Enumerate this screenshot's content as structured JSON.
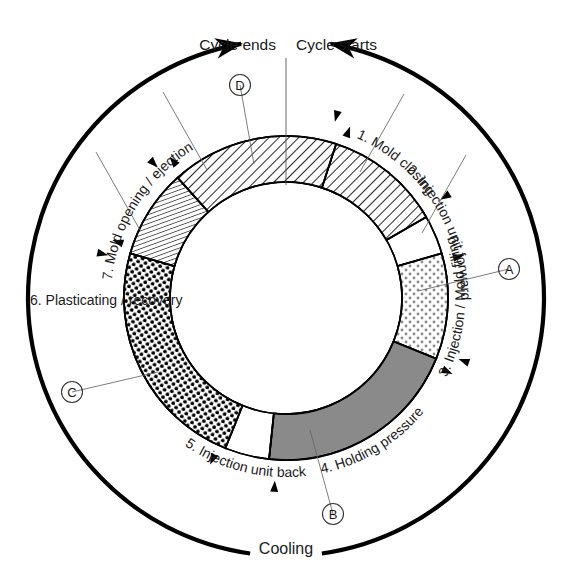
{
  "diagram": {
    "title_note": "Injection molding machine cycle diagram",
    "center": {
      "x": 286,
      "y": 298
    },
    "radii": {
      "inner": 116,
      "outer": 162,
      "tick_arc": 183,
      "cool_arc": 258
    },
    "headers": {
      "cycle_ends": "Cycle ends",
      "cycle_starts": "Cycle starts"
    },
    "cooling_label": "Cooling",
    "steps": [
      {
        "id": "s1",
        "label": "1. Mold closing",
        "fill": "hatch",
        "a0": -72,
        "a1": -30,
        "text_angle": -51
      },
      {
        "id": "s2",
        "label": "2. Injection unit forward",
        "fill": "none",
        "a0": -30,
        "a1": -16,
        "text_angle": -23
      },
      {
        "id": "s3",
        "label": "3. Injection / Mold filling",
        "fill": "dots-light",
        "a0": -16,
        "a1": 22,
        "text_angle": 3
      },
      {
        "id": "s4",
        "label": "4. Holding pressure",
        "fill": "gray",
        "a0": 22,
        "a1": 96,
        "text_angle": 59
      },
      {
        "id": "s5",
        "label": "5. Injection unit back",
        "fill": "none",
        "a0": 96,
        "a1": 112,
        "text_angle": 104
      },
      {
        "id": "s6",
        "label": "6. Plasticating / recovery",
        "fill": "dots-dark",
        "a0": 112,
        "a1": 196,
        "text_angle": 154
      },
      {
        "id": "s7",
        "label": "7. Mold opening / ejection",
        "fill": "hatch-fine",
        "a0": 196,
        "a1": 228,
        "text_angle": 212
      },
      {
        "id": "s8",
        "label": "",
        "fill": "hatch",
        "a0": 228,
        "a1": 288,
        "text_angle": 258
      }
    ],
    "markers": [
      {
        "id": "A",
        "label": "A",
        "cx": 509,
        "cy": 269,
        "lx": 418,
        "ly": 291
      },
      {
        "id": "B",
        "label": "B",
        "cx": 333,
        "cy": 514,
        "lx": 310,
        "ly": 430
      },
      {
        "id": "C",
        "label": "C",
        "cx": 72,
        "cy": 392,
        "lx": 158,
        "ly": 372
      },
      {
        "id": "D",
        "label": "D",
        "cx": 240,
        "cy": 85,
        "lx": 254,
        "ly": 164
      }
    ],
    "colors": {
      "gray_fill": "#8a8a8a",
      "line": "#000000",
      "text": "#1a1a1a",
      "thin": "#555555"
    }
  }
}
